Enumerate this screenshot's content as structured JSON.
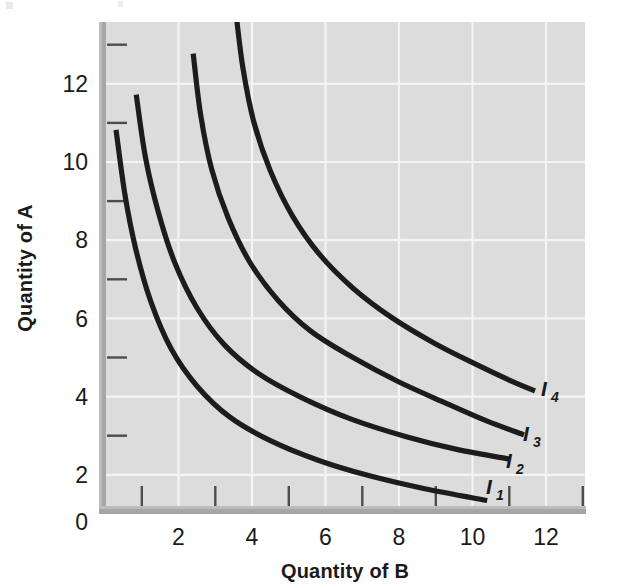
{
  "figure": {
    "caption_present": false,
    "background_color": "#ffffff",
    "plot_background_color": "#dddddd",
    "axis_bar_color": "#a8a8a8",
    "gridline_color": "#f2f2f2",
    "curve_color": "#1c1c1c"
  },
  "chart_data": {
    "type": "line",
    "title": "",
    "xlabel": "Quantity of B",
    "ylabel": "Quantity of A",
    "xlim": [
      0,
      13.2
    ],
    "ylim": [
      0,
      13.5
    ],
    "xticks": [
      2,
      4,
      6,
      8,
      10,
      12
    ],
    "yticks": [
      0,
      2,
      4,
      6,
      8,
      10,
      12
    ],
    "xtick_labels": [
      "2",
      "4",
      "6",
      "8",
      "10",
      "12"
    ],
    "ytick_labels": [
      "0",
      "2",
      "4",
      "6",
      "8",
      "10",
      "12"
    ],
    "x_minor_ticks": [
      1,
      3,
      5,
      7,
      9,
      11,
      13
    ],
    "y_minor_ticks": [
      1,
      3,
      5,
      7,
      9,
      11,
      13
    ],
    "grid": true,
    "grid_color": "#f2f2f2",
    "legend_position": "inline-right-end-of-curve",
    "series": [
      {
        "name": "I1",
        "label": "I",
        "subscript": "1",
        "points": [
          [
            0.3,
            9.8
          ],
          [
            0.55,
            8.1
          ],
          [
            0.85,
            6.7
          ],
          [
            1.25,
            5.4
          ],
          [
            1.8,
            4.2
          ],
          [
            2.5,
            3.25
          ],
          [
            3.4,
            2.45
          ],
          [
            4.5,
            1.85
          ],
          [
            5.8,
            1.35
          ],
          [
            7.2,
            0.95
          ],
          [
            8.7,
            0.62
          ],
          [
            10.4,
            0.32
          ]
        ]
      },
      {
        "name": "I2",
        "label": "I",
        "subscript": "2",
        "points": [
          [
            0.85,
            10.7
          ],
          [
            1.1,
            9.1
          ],
          [
            1.45,
            7.7
          ],
          [
            1.9,
            6.4
          ],
          [
            2.5,
            5.25
          ],
          [
            3.25,
            4.3
          ],
          [
            4.2,
            3.55
          ],
          [
            5.35,
            2.95
          ],
          [
            6.7,
            2.4
          ],
          [
            8.2,
            1.95
          ],
          [
            9.6,
            1.62
          ],
          [
            11.0,
            1.38
          ]
        ]
      },
      {
        "name": "I3",
        "label": "I",
        "subscript": "3",
        "points": [
          [
            2.4,
            11.75
          ],
          [
            2.6,
            10.2
          ],
          [
            2.9,
            8.8
          ],
          [
            3.35,
            7.55
          ],
          [
            3.95,
            6.4
          ],
          [
            4.7,
            5.45
          ],
          [
            5.6,
            4.65
          ],
          [
            6.7,
            4.0
          ],
          [
            8.0,
            3.35
          ],
          [
            9.3,
            2.8
          ],
          [
            10.4,
            2.35
          ],
          [
            11.4,
            2.0
          ]
        ]
      },
      {
        "name": "I4",
        "label": "I",
        "subscript": "4",
        "points": [
          [
            3.55,
            12.9
          ],
          [
            3.75,
            11.4
          ],
          [
            4.05,
            10.0
          ],
          [
            4.5,
            8.75
          ],
          [
            5.1,
            7.6
          ],
          [
            5.85,
            6.6
          ],
          [
            6.75,
            5.75
          ],
          [
            7.8,
            5.0
          ],
          [
            8.95,
            4.35
          ],
          [
            10.1,
            3.8
          ],
          [
            11.0,
            3.4
          ],
          [
            11.7,
            3.12
          ]
        ]
      }
    ],
    "annotations": [
      {
        "text": "I",
        "sub": "1",
        "x": 10.65,
        "y": 0.95
      },
      {
        "text": "I",
        "sub": "2",
        "x": 11.3,
        "y": 2.0
      },
      {
        "text": "I",
        "sub": "3",
        "x": 11.7,
        "y": 2.55
      },
      {
        "text": "I",
        "sub": "4",
        "x": 12.0,
        "y": 3.45
      }
    ]
  }
}
